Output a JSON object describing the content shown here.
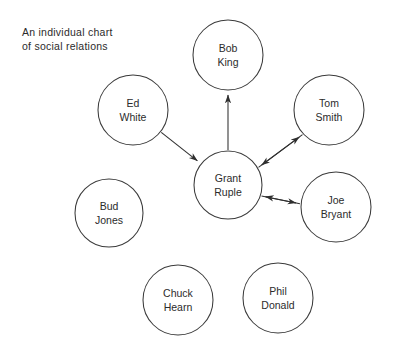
{
  "caption": {
    "line1": "An individual chart",
    "line2": "of social relations"
  },
  "chart_data": {
    "type": "diagram",
    "subtype": "sociogram",
    "title": "An individual chart of social relations",
    "background_color": "#ffffff",
    "node_stroke_color": "#3a3a3a",
    "edge_color": "#2f2f2f",
    "text_color": "#2b2b2b",
    "nodes": [
      {
        "id": "bob_king",
        "name_line1": "Bob",
        "name_line2": "King",
        "cx": 228,
        "cy": 55,
        "r": 35
      },
      {
        "id": "tom_smith",
        "name_line1": "Tom",
        "name_line2": "Smith",
        "cx": 329,
        "cy": 110,
        "r": 35
      },
      {
        "id": "joe_bryant",
        "name_line1": "Joe",
        "name_line2": "Bryant",
        "cx": 336,
        "cy": 207,
        "r": 35
      },
      {
        "id": "ed_white",
        "name_line1": "Ed",
        "name_line2": "White",
        "cx": 133,
        "cy": 110,
        "r": 35
      },
      {
        "id": "grant_ruple",
        "name_line1": "Grant",
        "name_line2": "Ruple",
        "cx": 228,
        "cy": 185,
        "r": 34
      },
      {
        "id": "bud_jones",
        "name_line1": "Bud",
        "name_line2": "Jones",
        "cx": 109,
        "cy": 213,
        "r": 34
      },
      {
        "id": "chuck_hearn",
        "name_line1": "Chuck",
        "name_line2": "Hearn",
        "cx": 178,
        "cy": 300,
        "r": 35
      },
      {
        "id": "phil_donald",
        "name_line1": "Phil",
        "name_line2": "Donald",
        "cx": 278,
        "cy": 298,
        "r": 35
      }
    ],
    "edges": [
      {
        "id": "edge-ed-white-to-grant-ruple",
        "from": "ed_white",
        "to": "grant_ruple",
        "direction": "one-way"
      },
      {
        "id": "edge-grant-ruple-to-bob-king",
        "from": "grant_ruple",
        "to": "bob_king",
        "direction": "one-way"
      },
      {
        "id": "edge-grant-ruple-to-tom-smith",
        "from": "grant_ruple",
        "to": "tom_smith",
        "direction": "one-way"
      },
      {
        "id": "edge-tom-smith-to-grant-ruple",
        "from": "tom_smith",
        "to": "grant_ruple",
        "direction": "one-way"
      },
      {
        "id": "edge-grant-ruple-to-joe-bryant",
        "from": "grant_ruple",
        "to": "joe_bryant",
        "direction": "one-way"
      },
      {
        "id": "edge-joe-bryant-to-grant-ruple",
        "from": "joe_bryant",
        "to": "grant_ruple",
        "direction": "one-way"
      }
    ],
    "isolates": [
      "bud_jones",
      "chuck_hearn",
      "phil_donald"
    ],
    "reciprocal_pairs": [
      [
        "grant_ruple",
        "tom_smith"
      ],
      [
        "grant_ruple",
        "joe_bryant"
      ]
    ]
  }
}
